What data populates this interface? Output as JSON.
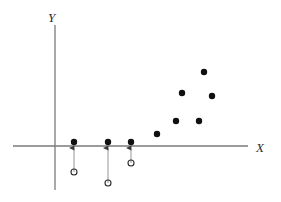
{
  "figure": {
    "width": 281,
    "height": 202,
    "background": "#ffffff"
  },
  "axes": {
    "x_label": "X",
    "y_label": "Y",
    "axis_color": "#7a7a7a",
    "x_axis": {
      "x1": 13,
      "y1": 146,
      "x2": 248,
      "y2": 146
    },
    "y_axis": {
      "x1": 55,
      "y1": 25,
      "x2": 55,
      "y2": 190
    },
    "x_label_pos": {
      "x": 256,
      "y": 152
    },
    "y_label_pos": {
      "x": 48,
      "y": 22
    }
  },
  "chart_data": {
    "type": "scatter",
    "title": "",
    "xlabel": "X",
    "ylabel": "Y",
    "grid": false,
    "legend": "none",
    "origin_px": {
      "x": 55,
      "y": 146
    },
    "observed_color": "#101010",
    "latent_color": "#2b2b2b",
    "censor_line_color": "#8a8a8a",
    "series": [
      {
        "name": "observed (censored at zero)",
        "marker": "filled-circle",
        "points": [
          {
            "x": 74,
            "y": 142
          },
          {
            "x": 108,
            "y": 142
          },
          {
            "x": 131,
            "y": 142
          }
        ]
      },
      {
        "name": "observed (uncensored)",
        "marker": "filled-circle",
        "points": [
          {
            "x": 157,
            "y": 134
          },
          {
            "x": 176,
            "y": 121
          },
          {
            "x": 182,
            "y": 93
          },
          {
            "x": 199,
            "y": 121
          },
          {
            "x": 204,
            "y": 72
          },
          {
            "x": 212,
            "y": 96
          }
        ]
      },
      {
        "name": "latent (unobserved, below zero)",
        "marker": "open-circle",
        "points": [
          {
            "x": 74,
            "y": 172
          },
          {
            "x": 108,
            "y": 183
          },
          {
            "x": 131,
            "y": 163
          }
        ]
      }
    ],
    "censor_arrows": [
      {
        "x": 74,
        "from_y": 172,
        "to_y": 148
      },
      {
        "x": 108,
        "from_y": 183,
        "to_y": 148
      },
      {
        "x": 131,
        "from_y": 163,
        "to_y": 148
      }
    ]
  },
  "markers": {
    "filled_radius": 3.2,
    "open_radius": 3.0,
    "open_stroke_width": 1.1
  }
}
